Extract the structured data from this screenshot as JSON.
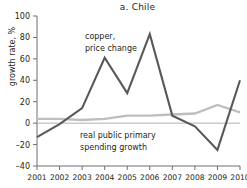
{
  "chart_data": {
    "type": "line",
    "title": "a. Chile",
    "xlabel": "",
    "ylabel": "growth rate, %",
    "x": [
      2001,
      2002,
      2003,
      2004,
      2005,
      2006,
      2007,
      2008,
      2009,
      2010
    ],
    "categories": [
      "2001",
      "2002",
      "2003",
      "2004",
      "2005",
      "2006",
      "2007",
      "2008",
      "2009",
      "2010"
    ],
    "ylim": [
      -40,
      100
    ],
    "yticks": [
      100,
      80,
      60,
      40,
      20,
      0,
      -20,
      -40
    ],
    "ytick_labels": [
      "100",
      "80",
      "60",
      "40",
      "20",
      "0",
      "–20",
      "–40"
    ],
    "grid": false,
    "legend_position": "inline-annotations",
    "series": [
      {
        "name": "copper, price change",
        "color": "#58595b",
        "values": [
          -13,
          -1,
          14,
          61,
          28,
          83,
          7,
          -3,
          -25,
          40
        ]
      },
      {
        "name": "real public primary spending growth",
        "color": "#bcbec0",
        "values": [
          4,
          4,
          3,
          4,
          7,
          7,
          8,
          9,
          17,
          10
        ]
      }
    ],
    "annotations": [
      {
        "id": "copper-annotation",
        "lines": [
          "copper,",
          "price change"
        ],
        "line1": "copper,",
        "line2": "price change"
      },
      {
        "id": "spending-annotation",
        "lines": [
          "real public primary",
          "spending growth"
        ],
        "line1": "real public primary",
        "line2": "spending growth"
      }
    ]
  },
  "colors": {
    "copper_line": "#58595b",
    "spending_line": "#bcbec0",
    "axis": "#6d6e71",
    "text": "#231f20",
    "background": "#ffffff"
  }
}
